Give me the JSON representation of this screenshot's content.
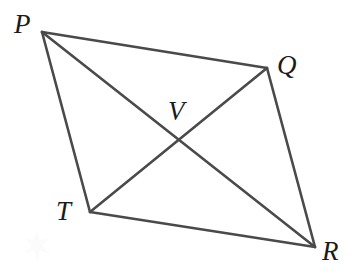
{
  "figure": {
    "type": "geometry-diagram",
    "width": 354,
    "height": 274,
    "background_color": "#ffffff",
    "stroke_color": "#4a4a4a",
    "stroke_width": 2.6,
    "label_color": "#1b1b1b"
  },
  "points": {
    "P": {
      "label": "P",
      "x": 42,
      "y": 32,
      "label_x": 14,
      "label_y": 11
    },
    "Q": {
      "label": "Q",
      "x": 267,
      "y": 68,
      "label_x": 277,
      "label_y": 52
    },
    "R": {
      "label": "R",
      "x": 315,
      "y": 247,
      "label_x": 322,
      "label_y": 238
    },
    "T": {
      "label": "T",
      "x": 90,
      "y": 212,
      "label_x": 56,
      "label_y": 198
    },
    "V": {
      "label": "V",
      "x": 179,
      "y": 138,
      "label_x": 168,
      "label_y": 98
    }
  },
  "segments": [
    {
      "name": "side-PQ",
      "from": "P",
      "to": "Q",
      "role": "side"
    },
    {
      "name": "side-QR",
      "from": "Q",
      "to": "R",
      "role": "side"
    },
    {
      "name": "side-RT",
      "from": "R",
      "to": "T",
      "role": "side"
    },
    {
      "name": "side-TP",
      "from": "T",
      "to": "P",
      "role": "side"
    },
    {
      "name": "diagonal-PR",
      "from": "P",
      "to": "R",
      "role": "diagonal"
    },
    {
      "name": "diagonal-TQ",
      "from": "T",
      "to": "Q",
      "role": "diagonal"
    }
  ]
}
